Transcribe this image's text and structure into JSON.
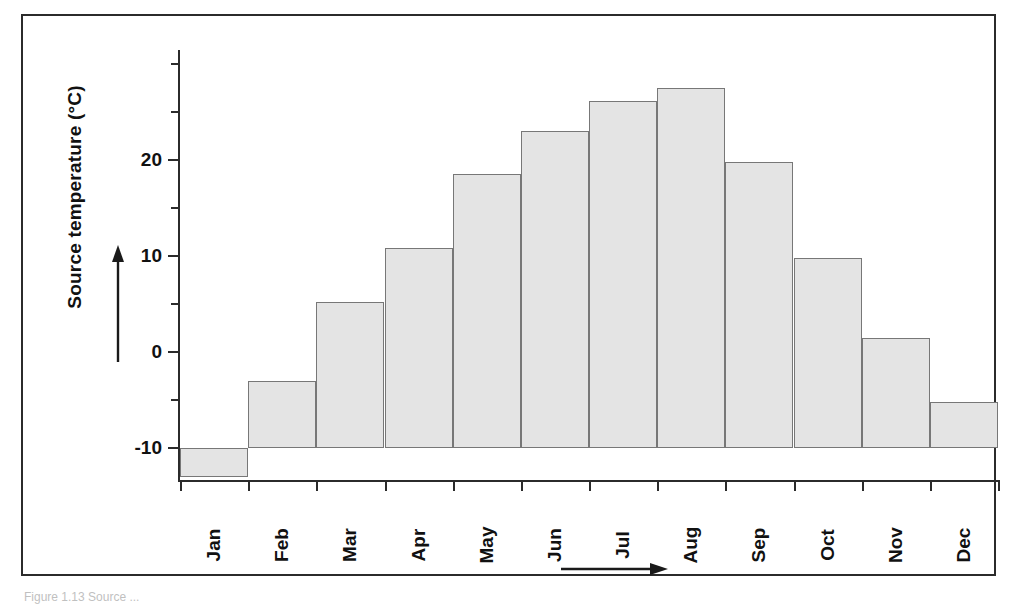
{
  "figure": {
    "caption": "Figure 1.13  Source ..."
  },
  "axes": {
    "y_title": "Source temperature (°C)",
    "y_tick_labels": [
      "20",
      "10",
      "0",
      "-10"
    ],
    "y_tick_values": [
      20,
      10,
      0,
      -10
    ],
    "y_minor_values": [
      30,
      25,
      15,
      5,
      -5
    ],
    "y_direction_arrow": "up-arrow-icon",
    "x_direction_arrow": "right-arrow-icon"
  },
  "chart_data": {
    "type": "bar",
    "title": "",
    "xlabel": "",
    "ylabel": "Source temperature (°C)",
    "categories": [
      "Jan",
      "Feb",
      "Mar",
      "Apr",
      "May",
      "Jun",
      "Jul",
      "Aug",
      "Sep",
      "Oct",
      "Nov",
      "Dec"
    ],
    "values": [
      -13.0,
      -3.0,
      5.3,
      10.9,
      18.6,
      23.1,
      26.2,
      27.5,
      19.8,
      9.8,
      1.5,
      -5.2
    ],
    "ylim": [
      -13.5,
      31.5
    ],
    "y_baseline": -10,
    "grid": false,
    "legend": null,
    "bar_fill": "#e4e4e4",
    "bar_border": "#777777"
  }
}
